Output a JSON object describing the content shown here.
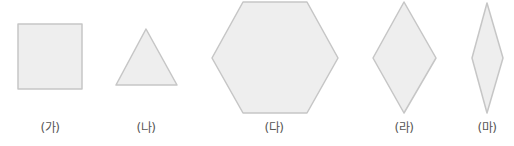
{
  "figure": {
    "colors": {
      "fill": "#eeeeee",
      "stroke": "#c6c6c6",
      "label": "#555555"
    },
    "shapes": [
      {
        "id": "ga",
        "label": "(가)",
        "type": "square",
        "points": "18,24 82,24 82,89 18,89",
        "label_x": 50
      },
      {
        "id": "na",
        "label": "(나)",
        "type": "triangle",
        "points": "146,29 116,85 177,85",
        "label_x": 146
      },
      {
        "id": "da",
        "label": "(다)",
        "type": "hexagon",
        "points": "243,2 307,2 338,58 307,113 243,113 212,58",
        "label_x": 274
      },
      {
        "id": "ra",
        "label": "(라)",
        "type": "rhombus",
        "points": "404,2 436,58 404,113 373,58",
        "label_x": 404
      },
      {
        "id": "ma",
        "label": "(마)",
        "type": "rhombus",
        "points": "487,3 503,58 487,113 472,58",
        "label_x": 487
      }
    ]
  }
}
